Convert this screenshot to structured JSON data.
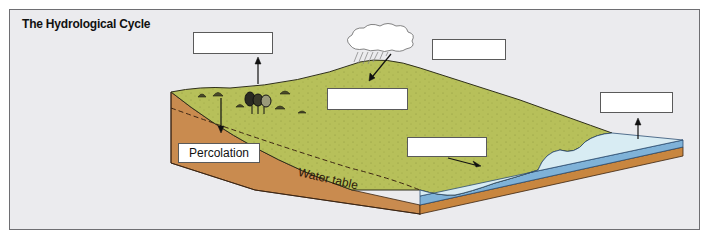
{
  "diagram": {
    "title": "The Hydrological Cycle",
    "labels": {
      "box_evapotranspiration": "",
      "box_precipitation": "",
      "box_infiltration": "",
      "box_runoff": "",
      "box_evaporation": "",
      "box_percolation": "Percolation"
    },
    "annotations": {
      "water_table": "Water table"
    },
    "elements": [
      "cloud",
      "rain",
      "trees",
      "shrubs",
      "land-surface",
      "soil-layer",
      "water-table-line",
      "sea"
    ],
    "colors": {
      "background": "#ebebee",
      "grass": "#b7c05a",
      "soil": "#c98b4f",
      "water_surface": "#d8ecf3",
      "water_edge": "#7fb2d8",
      "border": "#6e6e72"
    }
  }
}
